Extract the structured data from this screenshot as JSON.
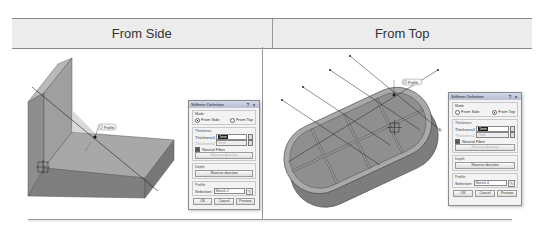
{
  "header": {
    "left_label": "From Side",
    "right_label": "From Top"
  },
  "left_panel": {
    "feature_tag": "Profile",
    "dialog": {
      "title": "Stiffener Definition",
      "help_icon": "?",
      "close_icon": "×",
      "mode_group": "Mode",
      "mode_options": [
        "From Side",
        "From Top"
      ],
      "mode_selected": "From Side",
      "thickness_group": "Thickness",
      "thickness1_label": "Thickness1",
      "thickness1_value": "1mm",
      "thickness2_label": "Thickness2",
      "thickness2_value": "1mm",
      "neutral_fiber_label": "Neutral Fiber",
      "neutral_fiber_checked": true,
      "reverse_direction_label": "Reverse direction",
      "depth_group": "Depth",
      "depth_reverse_label": "Reverse direction",
      "profile_group": "Profile",
      "selection_label": "Selection:",
      "selection_value": "Sketch.2",
      "ok_label": "OK",
      "cancel_label": "Cancel",
      "preview_label": "Preview"
    }
  },
  "right_panel": {
    "feature_tag": "Profile",
    "dialog": {
      "title": "Stiffener Definition",
      "help_icon": "?",
      "close_icon": "×",
      "mode_group": "Mode",
      "mode_options": [
        "From Side",
        "From Top"
      ],
      "mode_selected": "From Top",
      "thickness_group": "Thickness",
      "thickness1_label": "Thickness1",
      "thickness1_value": "1mm",
      "thickness2_label": "Thickness2",
      "thickness2_value": "1mm",
      "neutral_fiber_label": "Neutral Fiber",
      "neutral_fiber_checked": true,
      "reverse_direction_label": "Reverse direction",
      "depth_group": "Depth",
      "depth_reverse_label": "Reverse direction",
      "profile_group": "Profile",
      "selection_label": "Selection:",
      "selection_value": "Sketch.4",
      "ok_label": "OK",
      "cancel_label": "Cancel",
      "preview_label": "Preview"
    }
  }
}
